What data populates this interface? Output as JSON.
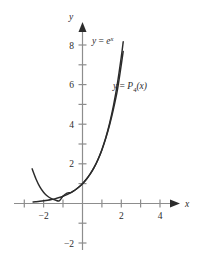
{
  "chart_data": {
    "type": "line",
    "title": "",
    "xlabel": "x",
    "ylabel": "y",
    "xlim": [
      -2.9,
      5.2
    ],
    "ylim": [
      -2.6,
      8.9
    ],
    "grid": false,
    "legend": "inline-annotations",
    "axis_color": "#8d8d8d",
    "curve_color": "#2b2b2b",
    "x_ticks": [
      -2,
      -1,
      1,
      2,
      3,
      4,
      5
    ],
    "x_tick_labels": [
      {
        "value": -2,
        "label": "−2"
      },
      {
        "value": 2,
        "label": "2"
      },
      {
        "value": 4,
        "label": "4"
      }
    ],
    "y_ticks": [
      -2,
      -1,
      1,
      2,
      3,
      4,
      5,
      6,
      7,
      8
    ],
    "y_tick_labels": [
      {
        "value": 8,
        "label": "8"
      },
      {
        "value": 6,
        "label": "6"
      },
      {
        "value": 4,
        "label": "4"
      },
      {
        "value": 2,
        "label": "2"
      },
      {
        "value": -2,
        "label": "−2"
      }
    ],
    "annotations": [
      {
        "name": "exponential-curve-label",
        "text": "y = e^x",
        "lhs": "y",
        "eq": "=",
        "base": "e",
        "exponent": "x",
        "x_px": 92,
        "y_px": 40
      },
      {
        "name": "taylor-polynomial-curve-label",
        "text": "y = P_4(x)",
        "lhs": "y",
        "eq": "=",
        "fn": "P",
        "order": "4",
        "arg": "(x)",
        "x_px": 113,
        "y_px": 85
      }
    ],
    "series": [
      {
        "name": "y = e^x",
        "expression": "exp(x)",
        "x": [
          -2.55,
          -2.4,
          -2.2,
          -2.0,
          -1.8,
          -1.6,
          -1.4,
          -1.2,
          -1.0,
          -0.8,
          -0.6,
          -0.4,
          -0.2,
          0.0,
          0.2,
          0.4,
          0.6,
          0.8,
          1.0,
          1.2,
          1.4,
          1.6,
          1.8,
          2.0,
          2.1
        ],
        "y": [
          0.078,
          0.091,
          0.111,
          0.135,
          0.165,
          0.202,
          0.247,
          0.301,
          0.368,
          0.449,
          0.549,
          0.67,
          0.819,
          1.0,
          1.221,
          1.492,
          1.822,
          2.226,
          2.718,
          3.32,
          4.055,
          4.953,
          6.05,
          7.389,
          8.166
        ]
      },
      {
        "name": "y = P_4(x)",
        "expression": "1 + x + x^2/2 + x^3/6 + x^4/24",
        "x": [
          -2.6,
          -2.4,
          -2.2,
          -2.0,
          -1.8,
          -1.6,
          -1.4,
          -1.2,
          -1.0,
          -0.8,
          -0.6,
          -0.4,
          -0.2,
          0.0,
          0.2,
          0.4,
          0.6,
          0.8,
          1.0,
          1.2,
          1.4,
          1.6,
          1.8,
          2.0,
          2.1
        ],
        "y": [
          1.75,
          1.24,
          0.84,
          0.556,
          0.366,
          0.246,
          0.175,
          0.134,
          0.375,
          0.524,
          0.549,
          0.67,
          0.819,
          1.0,
          1.221,
          1.492,
          1.822,
          2.226,
          2.708,
          3.29,
          3.979,
          4.787,
          5.726,
          7.0,
          7.68
        ]
      }
    ]
  },
  "figure": {
    "caption": ""
  }
}
